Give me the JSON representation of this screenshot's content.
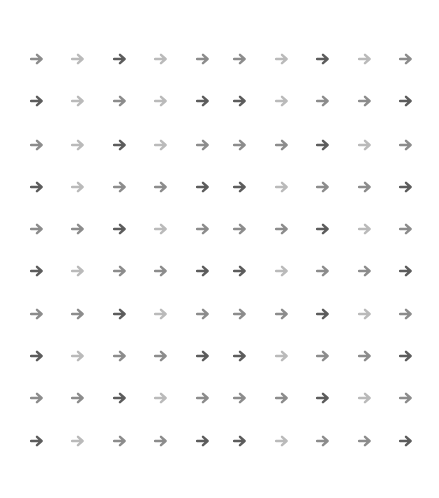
{
  "grid": {
    "rows": 10,
    "cols": 10,
    "icon": "arrow-right-icon",
    "column_x": [
      37,
      78,
      120,
      161,
      203,
      240,
      282,
      323,
      365,
      406
    ],
    "row_y": [
      59,
      101,
      145,
      187,
      229,
      271,
      314,
      356,
      398,
      441
    ],
    "shade_colors": {
      "D": "#5c5c5c",
      "M": "#8c8c8c",
      "L": "#bababa"
    },
    "shades": [
      [
        "M",
        "L",
        "D",
        "L",
        "M",
        "M",
        "L",
        "D",
        "L",
        "M"
      ],
      [
        "D",
        "L",
        "M",
        "L",
        "D",
        "D",
        "L",
        "M",
        "M",
        "D"
      ],
      [
        "M",
        "L",
        "D",
        "L",
        "M",
        "M",
        "M",
        "D",
        "L",
        "M"
      ],
      [
        "D",
        "L",
        "M",
        "M",
        "D",
        "D",
        "L",
        "M",
        "M",
        "D"
      ],
      [
        "M",
        "M",
        "D",
        "L",
        "M",
        "M",
        "M",
        "D",
        "L",
        "M"
      ],
      [
        "D",
        "L",
        "M",
        "M",
        "D",
        "D",
        "L",
        "M",
        "M",
        "D"
      ],
      [
        "M",
        "M",
        "D",
        "L",
        "M",
        "M",
        "M",
        "D",
        "L",
        "M"
      ],
      [
        "D",
        "L",
        "M",
        "M",
        "D",
        "D",
        "L",
        "M",
        "M",
        "D"
      ],
      [
        "M",
        "M",
        "D",
        "L",
        "M",
        "M",
        "M",
        "D",
        "L",
        "M"
      ],
      [
        "D",
        "L",
        "M",
        "M",
        "D",
        "D",
        "L",
        "M",
        "M",
        "D"
      ]
    ]
  }
}
